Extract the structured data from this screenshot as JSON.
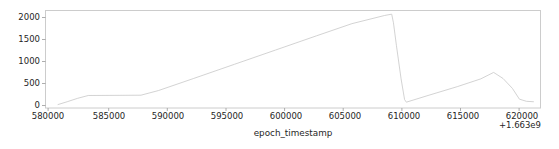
{
  "chart_data": {
    "type": "line",
    "title": "",
    "xlabel": "epoch_timestamp",
    "ylabel": "",
    "x_offset_label": "+1.663e9",
    "x_offset_value": 1663000000,
    "xticks": [
      580000,
      585000,
      590000,
      595000,
      600000,
      605000,
      610000,
      615000,
      620000
    ],
    "xtick_labels": [
      "580000",
      "585000",
      "590000",
      "595000",
      "600000",
      "605000",
      "610000",
      "615000",
      "620000"
    ],
    "yticks": [
      0,
      500,
      1000,
      1500,
      2000
    ],
    "ytick_labels": [
      "0",
      "500",
      "1000",
      "1500",
      "2000"
    ],
    "xlim": [
      579350,
      621600
    ],
    "ylim": [
      -75,
      2185
    ],
    "grid": false,
    "legend": null,
    "series": [
      {
        "name": "epoch_timestamp_series",
        "color": "#c8c8c8",
        "linewidth": 0.8,
        "x": [
          580420,
          581200,
          582100,
          583000,
          585200,
          587500,
          589000,
          592000,
          595500,
          599000,
          602500,
          605500,
          608300,
          608900,
          609050,
          609300,
          609700,
          610000,
          610150,
          612000,
          614500,
          616500,
          617600,
          618400,
          619200,
          619800,
          620400,
          621000
        ],
        "y": [
          5,
          70,
          150,
          215,
          218,
          222,
          330,
          610,
          940,
          1270,
          1600,
          1880,
          2070,
          2100,
          1900,
          1380,
          600,
          120,
          60,
          215,
          420,
          600,
          750,
          610,
          380,
          130,
          80,
          70
        ]
      }
    ]
  },
  "axes": {
    "frame_color": "#cccccc",
    "tick_color": "#808080",
    "text_color": "#262626",
    "background": "#ffffff"
  }
}
